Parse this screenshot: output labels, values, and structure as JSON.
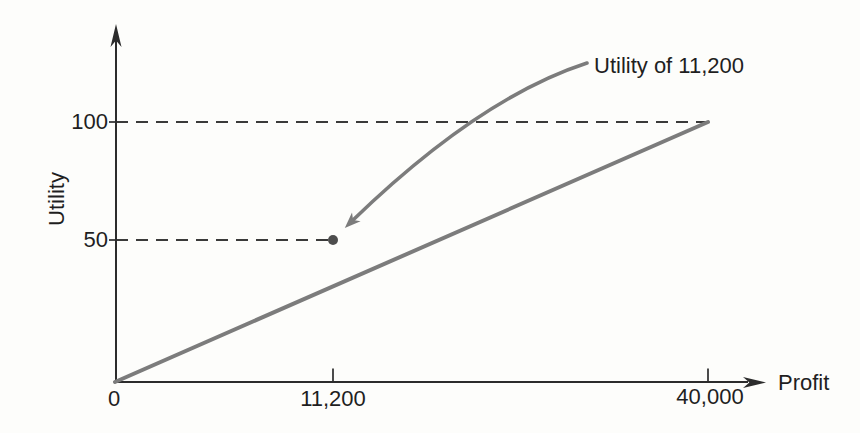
{
  "chart_data": {
    "type": "line",
    "title": "",
    "xlabel": "Profit",
    "ylabel": "Utility",
    "xlim": [
      0,
      43500
    ],
    "ylim": [
      0,
      137
    ],
    "grid": false,
    "legend": "none",
    "axes_not_to_scale": true,
    "x_ticks": [
      {
        "value": 0,
        "label": "0"
      },
      {
        "value": 11200,
        "label": "11,200"
      },
      {
        "value": 40000,
        "label": "40,000"
      }
    ],
    "y_ticks": [
      {
        "value": 50,
        "label": "50"
      },
      {
        "value": 100,
        "label": "100"
      }
    ],
    "series": [
      {
        "name": "linear-utility-line",
        "points": [
          {
            "x": 0,
            "utility": 0
          },
          {
            "x": 40000,
            "utility": 100
          }
        ]
      }
    ],
    "marked_point": {
      "x": 11200,
      "utility": 50
    },
    "annotation": {
      "text": "Utility of 11,200",
      "target": {
        "x": 11200,
        "utility": 50
      }
    },
    "guides": [
      {
        "utility": 100,
        "from_x": 0,
        "to_x": 40000,
        "style": "dashed"
      },
      {
        "utility": 50,
        "from_x": 0,
        "to_x": 11200,
        "style": "dashed"
      }
    ],
    "colors": {
      "axis": "#2c2c2c",
      "dashed_guide": "#3a3a3a",
      "utility_line": "#7c7c7c",
      "annotation_arrow": "#7c7c7c",
      "marked_point": "#4d4d4d",
      "text": "#1f1f1f",
      "background": "#fdfdfb"
    }
  }
}
